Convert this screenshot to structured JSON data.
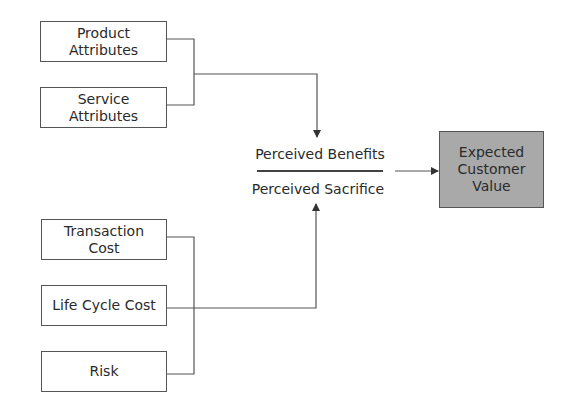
{
  "diagram": {
    "benefit_inputs": [
      {
        "id": "product-attributes",
        "lines": [
          "Product",
          "Attributes"
        ]
      },
      {
        "id": "service-attributes",
        "lines": [
          "Service",
          "Attributes"
        ]
      }
    ],
    "sacrifice_inputs": [
      {
        "id": "transaction-cost",
        "lines": [
          "Transaction",
          "Cost"
        ]
      },
      {
        "id": "life-cycle-cost",
        "lines": [
          "Life Cycle Cost"
        ]
      },
      {
        "id": "risk",
        "lines": [
          "Risk"
        ]
      }
    ],
    "ratio": {
      "numerator": "Perceived Benefits",
      "denominator": "Perceived Sacrifice"
    },
    "output": {
      "lines": [
        "Expected",
        "Customer",
        "Value"
      ],
      "fill_color": "#a9a9a9"
    },
    "colors": {
      "line": "#555555",
      "box_border": "#555555",
      "text": "#2a2a2a"
    }
  }
}
